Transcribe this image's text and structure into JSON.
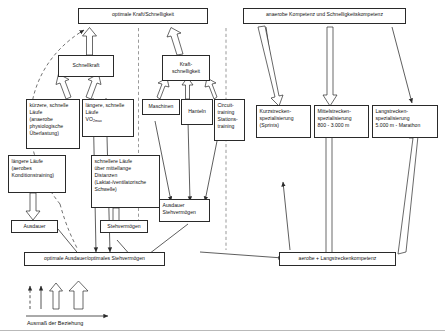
{
  "diagram": {
    "title_text": "Ausmaß der Beziehung",
    "nodes": {
      "optimale_kraft_schnelligkeit": {
        "lines": [
          "optimale Kraft/Schnelligkeit"
        ]
      },
      "anaerobe_kompetenz": {
        "lines": [
          "anaerobe Kompetenz und Schnelligkeitskompetenz"
        ]
      },
      "schnellkraft": {
        "lines": [
          "Schnellkraft"
        ]
      },
      "kraftschnelligkeit": {
        "lines": [
          "Kraft-",
          "schnelligkeit"
        ]
      },
      "kuerzere_schnelle_laeufe": {
        "lines": [
          "kürzere, schnelle",
          "Läufe",
          "(anaerobe",
          "physiologische",
          "Überlastung)"
        ]
      },
      "laengere_schnelle_laeufe": {
        "lines": [
          "längere, schnelle",
          "Läufe",
          "VO2max"
        ]
      },
      "maschinen": {
        "lines": [
          "Maschinen"
        ]
      },
      "hanteln": {
        "lines": [
          "Hanteln"
        ]
      },
      "circuittraining": {
        "lines": [
          "Circuit-",
          "training",
          "Stations-",
          "training"
        ]
      },
      "kurzstrecken": {
        "lines": [
          "Kurzstrecken-",
          "spezialisierung",
          "(Sprints)"
        ]
      },
      "mittelstrecken": {
        "lines": [
          "Mittelstrecken-",
          "spezialisierung",
          "800 - 3.000 m"
        ]
      },
      "langstrecken": {
        "lines": [
          "Langstrecken-",
          "spezialisierung",
          "5.000 m - Marathon"
        ]
      },
      "laengere_laeufe_aerob": {
        "lines": [
          "längere Läufe",
          "(aerobes",
          "Konditionstraining)"
        ]
      },
      "schnellere_laeufe_mittel": {
        "lines": [
          "schnellere Läufe",
          "über mittellange",
          "Distanzen",
          "(Laktat-/ventilatorische",
          "Schwelle)"
        ]
      },
      "ausdauer": {
        "lines": [
          "Ausdauer"
        ]
      },
      "stehvermoegen": {
        "lines": [
          "Stehvermögen"
        ]
      },
      "ausdauer_stehvermoegen": {
        "lines": [
          "Ausdauer",
          "Stehvermögen"
        ]
      },
      "optimale_ausdauer": {
        "lines": [
          "optimale Ausdauer/optimales Stehvermögen"
        ]
      },
      "aerobe_langstreckenkompetenz": {
        "lines": [
          "aerobe + Langstreckenkompetenz"
        ]
      }
    },
    "legend": {
      "caption": "Ausmaß der Beziehung",
      "markers": [
        "dashed-thin-arrow",
        "solid-thin-arrow",
        "medium-hollow-arrow",
        "large-hollow-arrow"
      ]
    },
    "colors": {
      "stroke": "#2a2a2a",
      "text": "#111111",
      "background": "#ffffff",
      "rule": "#b9b9b9"
    }
  }
}
